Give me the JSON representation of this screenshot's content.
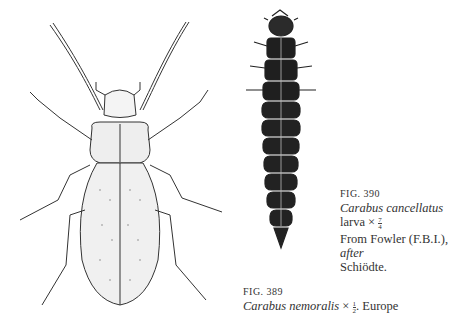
{
  "figures": [
    {
      "id": "fig390",
      "label": "FIG. 390",
      "species": "Carabus cancellatus",
      "stage": "larva",
      "scale_symbol": "×",
      "scale_numerator": "7",
      "scale_denominator": "4",
      "source_line_prefix": "From Fowler (F.B.I.), ",
      "source_line_italic": "after",
      "source_line_suffix": "Schiödte."
    },
    {
      "id": "fig389",
      "label": "FIG. 389",
      "species": "Carabus nemoralis",
      "scale_symbol": "×",
      "scale_numerator": "1",
      "scale_denominator": "2",
      "region": ". Europe"
    }
  ],
  "illustrations": {
    "beetle": "Carabus nemoralis adult, dorsal view line drawing",
    "larva": "Carabus cancellatus larva, dorsal view dark engraving"
  }
}
